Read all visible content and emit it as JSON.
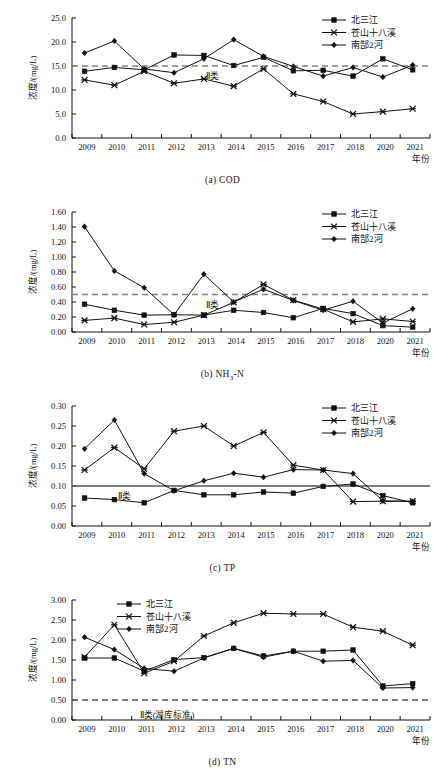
{
  "figure": {
    "axis_y_label": "浓度/(mg/L)",
    "axis_x_label": "年份",
    "series_names": [
      "北三江",
      "苍山十八溪",
      "南郜2河"
    ],
    "years": [
      "2009",
      "2010",
      "2011",
      "2012",
      "2013",
      "2014",
      "2015",
      "2016",
      "2017",
      "2018",
      "2020",
      "2021"
    ]
  },
  "panels": [
    {
      "caption_prefix": "(a)",
      "caption_text": "COD",
      "caption_sub": "",
      "threshold_label": "Ⅱ类"
    },
    {
      "caption_prefix": "(b)",
      "caption_text_pre": "NH",
      "caption_sub": "3",
      "caption_text_post": "-N",
      "threshold_label": "Ⅱ类"
    },
    {
      "caption_prefix": "(c)",
      "caption_text": "TP",
      "threshold_label": "Ⅱ类"
    },
    {
      "caption_prefix": "(d)",
      "caption_text": "TN",
      "threshold_label": "Ⅱ类(湖库标准)"
    }
  ],
  "chart_data": [
    {
      "type": "line",
      "title": "(a) COD",
      "xlabel": "年份",
      "ylabel": "浓度/(mg/L)",
      "x": [
        "2009",
        "2010",
        "2011",
        "2012",
        "2013",
        "2014",
        "2015",
        "2016",
        "2017",
        "2018",
        "2020",
        "2021"
      ],
      "ylim": [
        0.0,
        25.0
      ],
      "yticks": [
        "0.0",
        "5.0",
        "10.0",
        "15.0",
        "20.0",
        "25.0"
      ],
      "ytick_values": [
        0.0,
        5.0,
        10.0,
        15.0,
        20.0,
        25.0
      ],
      "grid": false,
      "legend_position": "top-right",
      "threshold": {
        "value": 15.0,
        "style": "dashed",
        "label": "Ⅱ类",
        "color": "#808080"
      },
      "series": [
        {
          "name": "北三江",
          "marker": "square",
          "values": [
            13.9,
            14.7,
            14.2,
            17.3,
            17.2,
            15.1,
            16.8,
            14.0,
            14.1,
            12.9,
            16.5,
            14.2
          ]
        },
        {
          "name": "苍山十八溪",
          "marker": "star",
          "values": [
            12.1,
            11.0,
            13.9,
            11.4,
            12.3,
            10.8,
            14.4,
            9.2,
            7.6,
            5.0,
            5.5,
            6.1
          ]
        },
        {
          "name": "南郜2河",
          "marker": "diamond",
          "values": [
            17.7,
            20.2,
            14.4,
            13.6,
            16.5,
            20.5,
            17.0,
            14.9,
            12.9,
            14.7,
            12.7,
            15.2
          ]
        }
      ]
    },
    {
      "type": "line",
      "title": "(b) NH3-N",
      "xlabel": "年份",
      "ylabel": "浓度/(mg/L)",
      "x": [
        "2009",
        "2010",
        "2011",
        "2012",
        "2013",
        "2014",
        "2015",
        "2016",
        "2017",
        "2018",
        "2020",
        "2021"
      ],
      "ylim": [
        0.0,
        1.6
      ],
      "yticks": [
        "0.00",
        "0.20",
        "0.40",
        "0.60",
        "0.80",
        "1.00",
        "1.20",
        "1.40",
        "1.60"
      ],
      "ytick_values": [
        0.0,
        0.2,
        0.4,
        0.6,
        0.8,
        1.0,
        1.2,
        1.4,
        1.6
      ],
      "grid": false,
      "legend_position": "top-right",
      "threshold": {
        "value": 0.5,
        "style": "dashed",
        "label": "Ⅱ类",
        "color": "#808080"
      },
      "series": [
        {
          "name": "北三江",
          "marker": "square",
          "values": [
            0.37,
            0.29,
            0.225,
            0.23,
            0.225,
            0.29,
            0.26,
            0.19,
            0.315,
            0.245,
            0.085,
            0.065
          ]
        },
        {
          "name": "苍山十八溪",
          "marker": "star",
          "values": [
            0.155,
            0.185,
            0.1,
            0.13,
            0.225,
            0.395,
            0.635,
            0.425,
            0.305,
            0.135,
            0.175,
            0.14
          ]
        },
        {
          "name": "南郜2河",
          "marker": "diamond",
          "values": [
            1.405,
            0.815,
            0.59,
            0.23,
            0.77,
            0.4,
            0.57,
            0.42,
            0.29,
            0.41,
            0.12,
            0.31
          ]
        }
      ]
    },
    {
      "type": "line",
      "title": "(c) TP",
      "xlabel": "年份",
      "ylabel": "浓度/(mg/L)",
      "x": [
        "2009",
        "2010",
        "2011",
        "2012",
        "2013",
        "2014",
        "2015",
        "2016",
        "2017",
        "2018",
        "2020",
        "2021"
      ],
      "ylim": [
        0.0,
        0.3
      ],
      "yticks": [
        "0.00",
        "0.05",
        "0.10",
        "0.15",
        "0.20",
        "0.25",
        "0.30"
      ],
      "ytick_values": [
        0.0,
        0.05,
        0.1,
        0.15,
        0.2,
        0.25,
        0.3
      ],
      "grid": false,
      "legend_position": "top-right",
      "threshold": {
        "value": 0.1,
        "style": "solid",
        "label": "Ⅱ类",
        "color": "#555555"
      },
      "series": [
        {
          "name": "北三江",
          "marker": "square",
          "values": [
            0.07,
            0.066,
            0.058,
            0.089,
            0.078,
            0.078,
            0.085,
            0.082,
            0.099,
            0.105,
            0.076,
            0.058
          ]
        },
        {
          "name": "苍山十八溪",
          "marker": "star",
          "values": [
            0.14,
            0.196,
            0.143,
            0.237,
            0.25,
            0.2,
            0.234,
            0.152,
            0.14,
            0.061,
            0.062,
            0.062
          ]
        },
        {
          "name": "南郜2河",
          "marker": "diamond",
          "values": [
            0.193,
            0.265,
            0.131,
            0.088,
            0.113,
            0.132,
            0.122,
            0.141,
            0.14,
            0.131,
            0.063,
            0.061
          ]
        }
      ]
    },
    {
      "type": "line",
      "title": "(d) TN",
      "xlabel": "年份",
      "ylabel": "浓度/(mg/L)",
      "x": [
        "2009",
        "2010",
        "2011",
        "2012",
        "2013",
        "2014",
        "2015",
        "2016",
        "2017",
        "2018",
        "2020",
        "2021"
      ],
      "ylim": [
        0.0,
        3.0
      ],
      "yticks": [
        "0.00",
        "0.50",
        "1.00",
        "1.50",
        "2.00",
        "2.50",
        "3.00"
      ],
      "ytick_values": [
        0.0,
        0.5,
        1.0,
        1.5,
        2.0,
        2.5,
        3.0
      ],
      "grid": false,
      "legend_position": "top-left",
      "threshold": {
        "value": 0.5,
        "style": "dashed",
        "label": "Ⅱ类(湖库标准)",
        "color": "#555555"
      },
      "series": [
        {
          "name": "北三江",
          "marker": "square",
          "values": [
            1.55,
            1.55,
            1.22,
            1.51,
            1.56,
            1.79,
            1.6,
            1.72,
            1.72,
            1.75,
            0.85,
            0.91
          ]
        },
        {
          "name": "苍山十八溪",
          "marker": "star",
          "values": [
            1.57,
            2.38,
            1.17,
            1.47,
            2.1,
            2.43,
            2.67,
            2.65,
            2.65,
            2.32,
            2.22,
            1.87
          ]
        },
        {
          "name": "南郜2河",
          "marker": "diamond",
          "values": [
            2.07,
            1.76,
            1.29,
            1.22,
            1.55,
            1.79,
            1.57,
            1.72,
            1.47,
            1.49,
            0.8,
            0.81
          ]
        }
      ]
    }
  ]
}
